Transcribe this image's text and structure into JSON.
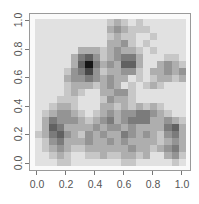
{
  "chart_data": {
    "type": "heatmap",
    "title": "",
    "xlabel": "",
    "ylabel": "",
    "xlim": [
      0.0,
      1.0
    ],
    "ylim": [
      0.0,
      1.0
    ],
    "x_ticks": [
      "0.0",
      "0.2",
      "0.4",
      "0.6",
      "0.8",
      "1.0"
    ],
    "y_ticks": [
      "0.0",
      "0.2",
      "0.4",
      "0.6",
      "0.8",
      "1.0"
    ],
    "colormap": "grayscale (white = low, black = high)",
    "grid_size": [
      21,
      21
    ],
    "intensity_scale": "0 (white) to 9 (black)",
    "rows_top_to_bottom": [
      "111111111123212111111",
      "111111111134322211111",
      "111111111123221121111",
      "111111111133421211111",
      "111111333234332121111",
      "111113564234553111221",
      "111113695343663113432",
      "111124574233442133434",
      "111134454343312123323",
      "111123332343121232111",
      "111123211334421111111",
      "111222111243321111111",
      "112332111332323232111",
      "123443212343445543211",
      "135444323453455533432",
      "136533334344343333563",
      "235643243433543432453",
      "124533343343433332343",
      "123432233333343323453",
      "112321122322332311342",
      "111221111111221111121"
    ],
    "grid": false,
    "legend": null
  },
  "axes": {
    "x_tick_labels": [
      "0.0",
      "0.2",
      "0.4",
      "0.6",
      "0.8",
      "1.0"
    ],
    "y_tick_labels": [
      "0.0",
      "0.2",
      "0.4",
      "0.6",
      "0.8",
      "1.0"
    ]
  },
  "colors": {
    "frame": "#9a9a9a",
    "tick_label": "#555555",
    "background": "#fafafa"
  }
}
